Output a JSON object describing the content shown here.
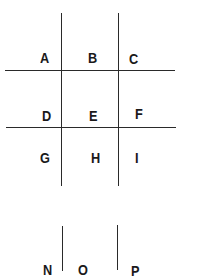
{
  "diagram": {
    "type": "grid-labels",
    "grid_1": {
      "rows": [
        [
          "A",
          "B",
          "C"
        ],
        [
          "D",
          "E",
          "F"
        ],
        [
          "G",
          "H",
          "I"
        ]
      ]
    },
    "grid_2_partial": {
      "rows": [
        [
          "N",
          "O",
          "P"
        ]
      ],
      "note_visible": "letters cut off at bottom edge"
    },
    "line_color": "#2a2a2a",
    "background": "#ffffff"
  }
}
